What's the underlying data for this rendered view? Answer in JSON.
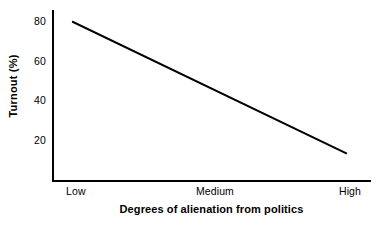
{
  "chart_data": {
    "type": "line",
    "title": "",
    "subtitle": "",
    "xlabel": "Degrees of alienation from politics",
    "ylabel": "Turnout (%)",
    "x_tick_labels": [
      "Low",
      "Medium",
      "High"
    ],
    "y_tick_labels": [
      "80",
      "60",
      "40",
      "20"
    ],
    "y_ticks": [
      80,
      60,
      40,
      20
    ],
    "ylim": [
      0,
      86
    ],
    "xlim": [
      0,
      2
    ],
    "grid": false,
    "legend": null,
    "annotations": [],
    "series": [
      {
        "name": "Turnout",
        "color": "#000000",
        "line_width": 2,
        "x": [
          "Low",
          "High"
        ],
        "values": [
          80,
          14
        ]
      }
    ]
  },
  "figure": {
    "background_color": "#ffffff",
    "axis_color": "#000000"
  }
}
